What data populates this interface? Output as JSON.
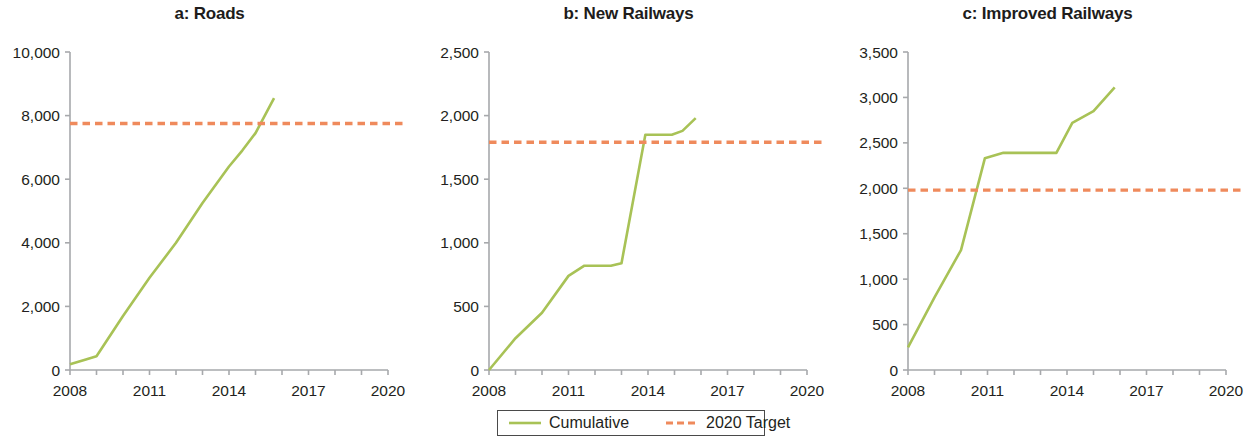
{
  "figure": {
    "background": "#ffffff",
    "line_color": "#a8c256",
    "target_color": "#ef8a5c",
    "axis_color": "#a7a9ac",
    "text_color": "#231f20"
  },
  "legend": {
    "items": [
      {
        "label": "Cumulative",
        "style": "solid",
        "color": "#a8c256"
      },
      {
        "label": "2020 Target",
        "style": "dashed",
        "color": "#ef8a5c"
      }
    ]
  },
  "chart_data": [
    {
      "type": "line",
      "panel_id": "a",
      "title": "a: Roads",
      "xlabel": "",
      "ylabel": "",
      "xlim": [
        2008,
        2020
      ],
      "ylim": [
        0,
        10000
      ],
      "xticks": [
        2008,
        2009,
        2010,
        2011,
        2012,
        2013,
        2014,
        2015,
        2016,
        2017,
        2018,
        2019,
        2020
      ],
      "xticklabels": [
        "2008",
        "",
        "",
        "2011",
        "",
        "",
        "2014",
        "",
        "",
        "2017",
        "",
        "",
        "2020"
      ],
      "yticks": [
        0,
        2000,
        4000,
        6000,
        8000,
        10000
      ],
      "yticklabels": [
        "0",
        "2,000",
        "4,000",
        "6,000",
        "8,000",
        "10,000"
      ],
      "grid": false,
      "series": [
        {
          "name": "Cumulative",
          "style": "solid",
          "color": "#a8c256",
          "x": [
            2008,
            2008.6,
            2009,
            2010,
            2011,
            2012,
            2013,
            2014,
            2014.5,
            2015,
            2015.7
          ],
          "values": [
            180,
            330,
            430,
            1700,
            2900,
            4000,
            5250,
            6400,
            6900,
            7450,
            8550
          ]
        },
        {
          "name": "2020 Target",
          "style": "dashed",
          "color": "#ef8a5c",
          "x": [
            2008,
            2020.6
          ],
          "values": [
            7750,
            7750
          ]
        }
      ]
    },
    {
      "type": "line",
      "panel_id": "b",
      "title": "b: New Railways",
      "xlabel": "",
      "ylabel": "",
      "xlim": [
        2008,
        2020
      ],
      "ylim": [
        0,
        2500
      ],
      "xticks": [
        2008,
        2009,
        2010,
        2011,
        2012,
        2013,
        2014,
        2015,
        2016,
        2017,
        2018,
        2019,
        2020
      ],
      "xticklabels": [
        "2008",
        "",
        "",
        "2011",
        "",
        "",
        "2014",
        "",
        "",
        "2017",
        "",
        "",
        "2020"
      ],
      "yticks": [
        0,
        500,
        1000,
        1500,
        2000,
        2500
      ],
      "yticklabels": [
        "0",
        "500",
        "1,000",
        "1,500",
        "2,000",
        "2,500"
      ],
      "grid": false,
      "series": [
        {
          "name": "Cumulative",
          "style": "solid",
          "color": "#a8c256",
          "x": [
            2008,
            2009,
            2010,
            2011,
            2011.6,
            2012.6,
            2013,
            2013.9,
            2014.9,
            2015.3,
            2015.8
          ],
          "values": [
            0,
            250,
            450,
            740,
            820,
            820,
            840,
            1850,
            1850,
            1880,
            1980
          ]
        },
        {
          "name": "2020 Target",
          "style": "dashed",
          "color": "#ef8a5c",
          "x": [
            2008,
            2020.6
          ],
          "values": [
            1790,
            1790
          ]
        }
      ]
    },
    {
      "type": "line",
      "panel_id": "c",
      "title": "c: Improved Railways",
      "xlabel": "",
      "ylabel": "",
      "xlim": [
        2008,
        2020
      ],
      "ylim": [
        0,
        3500
      ],
      "xticks": [
        2008,
        2009,
        2010,
        2011,
        2012,
        2013,
        2014,
        2015,
        2016,
        2017,
        2018,
        2019,
        2020
      ],
      "xticklabels": [
        "2008",
        "",
        "",
        "2011",
        "",
        "",
        "2014",
        "",
        "",
        "2017",
        "",
        "",
        "2020"
      ],
      "yticks": [
        0,
        500,
        1000,
        1500,
        2000,
        2500,
        3000,
        3500
      ],
      "yticklabels": [
        "0",
        "500",
        "1,000",
        "1,500",
        "2,000",
        "2,500",
        "3,000",
        "3,500"
      ],
      "grid": false,
      "series": [
        {
          "name": "Cumulative",
          "style": "solid",
          "color": "#a8c256",
          "x": [
            2008,
            2009,
            2010,
            2010.9,
            2011.6,
            2013,
            2013.6,
            2014.2,
            2015,
            2015.8
          ],
          "values": [
            250,
            800,
            1320,
            2330,
            2390,
            2390,
            2390,
            2720,
            2850,
            3110
          ]
        },
        {
          "name": "2020 Target",
          "style": "dashed",
          "color": "#ef8a5c",
          "x": [
            2008,
            2020.6
          ],
          "values": [
            1980,
            1980
          ]
        }
      ]
    }
  ]
}
